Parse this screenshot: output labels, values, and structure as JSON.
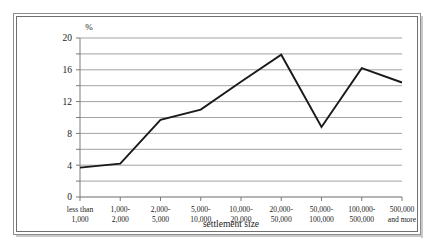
{
  "chart_data": {
    "type": "line",
    "title": "",
    "subtitle": "",
    "xlabel": "settlement size",
    "ylabel": "%",
    "unit_label": "%",
    "categories": [
      "less than\n1,000",
      "1,000-\n2,000",
      "2,000-\n5,000",
      "5,000-\n10,000",
      "10,000-\n20,000",
      "20,000-\n50,000",
      "50,000-\n100,000",
      "100,000-\n500,000",
      "500,000\nand more"
    ],
    "category_lines": [
      [
        "less than",
        "1,000"
      ],
      [
        "1,000-",
        "2,000"
      ],
      [
        "2,000-",
        "5,000"
      ],
      [
        "5,000-",
        "10,000"
      ],
      [
        "10,000-",
        "20,000"
      ],
      [
        "20,000-",
        "50,000"
      ],
      [
        "50,000-",
        "100,000"
      ],
      [
        "100,000-",
        "500,000"
      ],
      [
        "500,000",
        "and more"
      ]
    ],
    "values": [
      3.7,
      4.2,
      9.7,
      11.0,
      14.5,
      17.9,
      8.8,
      16.2,
      14.4
    ],
    "ylim": [
      0,
      20
    ],
    "y_major_ticks": [
      0,
      4,
      8,
      12,
      16,
      20
    ],
    "y_minor_gridlines": [
      2,
      6,
      10,
      14,
      18
    ],
    "y_tick_labels": [
      "0",
      "4",
      "8",
      "12",
      "16",
      "20"
    ],
    "grid": true,
    "legend": "none",
    "series": [
      {
        "name": "share",
        "color": "#1a1a1a",
        "values": [
          3.7,
          4.2,
          9.7,
          11.0,
          14.5,
          17.9,
          8.8,
          16.2,
          14.4
        ]
      }
    ]
  },
  "colors": {
    "line": "#1a1a1a",
    "grid": "#8a8a8a",
    "axis": "#7d7d7d",
    "frame": "#8e8e8e",
    "background": "#ffffff",
    "text": "#1a1a1a"
  }
}
